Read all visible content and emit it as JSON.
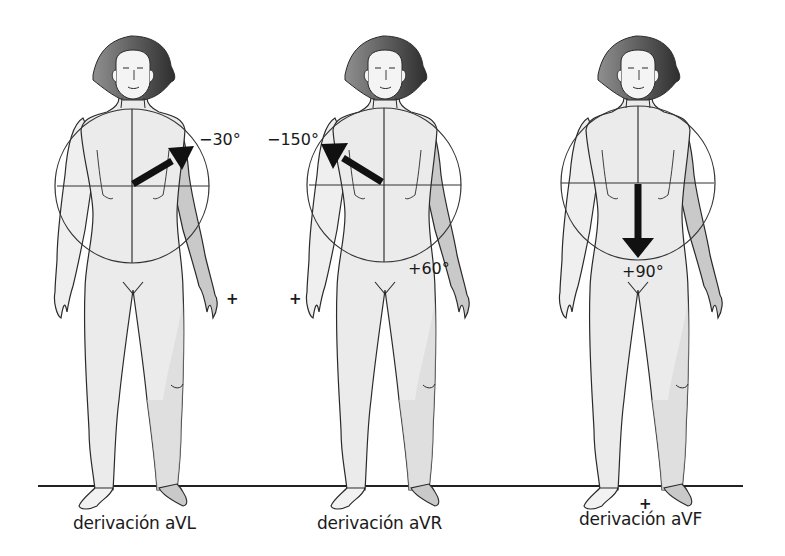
{
  "figures": [
    {
      "id": "aVL",
      "label": "derivación aVL",
      "angle_label": "−30°",
      "angle_deg": -30,
      "center_x": 133,
      "plus_sign": "+"
    },
    {
      "id": "aVR",
      "label": "derivación aVR",
      "angle_label": "−150°",
      "angle_deg": -150,
      "center_x": 385,
      "extra_angle_label": "+60°",
      "plus_sign": "+"
    },
    {
      "id": "aVF",
      "label": "derivación aVF",
      "angle_label": "+90°",
      "angle_deg": 90,
      "center_x": 638,
      "plus_sign": "+"
    }
  ],
  "colors": {
    "skin": "#ebebeb",
    "skin_shade": "#c9c9c9",
    "hair_light": "#8a8a8a",
    "hair_dark": "#3e3e3e",
    "outline": "#2a2a2a",
    "arrow": "#111111",
    "ground": "#222222"
  }
}
